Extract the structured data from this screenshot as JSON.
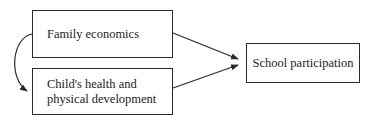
{
  "diagram": {
    "nodes": [
      {
        "id": "family",
        "label": "Family economics"
      },
      {
        "id": "health",
        "label": "Child's health and\nphysical development"
      },
      {
        "id": "school",
        "label": "School participation"
      }
    ],
    "edges": [
      {
        "from": "family",
        "to": "school",
        "style": "straight-arrow"
      },
      {
        "from": "health",
        "to": "school",
        "style": "straight-arrow"
      },
      {
        "from": "family",
        "to": "health",
        "style": "curved-arrow"
      }
    ],
    "colors": {
      "line": "#2a2a2a",
      "background": "#ffffff"
    }
  }
}
